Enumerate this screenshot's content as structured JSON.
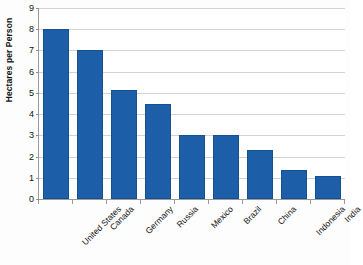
{
  "chart_data": {
    "type": "bar",
    "title": "",
    "xlabel": "",
    "ylabel": "Hectares per Person",
    "ylim": [
      0,
      9
    ],
    "ytick_labels": [
      "0",
      "1",
      "2",
      "3",
      "4",
      "5",
      "6",
      "7",
      "8",
      "9"
    ],
    "ytick_values": [
      0,
      1,
      2,
      3,
      4,
      5,
      6,
      7,
      8,
      9
    ],
    "grid": true,
    "legend": "none",
    "bar_color": "#1c5fa8",
    "gridline_color": "#d2d2d2",
    "axis_color": "#9a9a9a",
    "categories": [
      "United States",
      "Canada",
      "Germany",
      "Russia",
      "Mexico",
      "Brazil",
      "China",
      "Indonesia",
      "India"
    ],
    "values": [
      8.0,
      7.0,
      5.15,
      4.5,
      3.0,
      3.0,
      2.3,
      1.35,
      1.1
    ]
  }
}
